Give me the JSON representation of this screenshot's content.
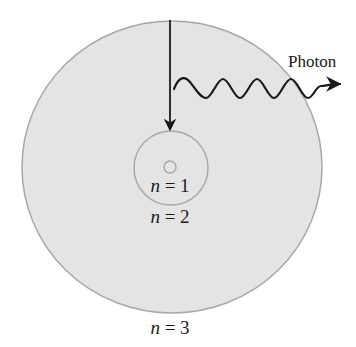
{
  "figure": {
    "photon_label": "Photon",
    "levels": [
      {
        "var": "n",
        "eq": " = 1",
        "label": "n = 1"
      },
      {
        "var": "n",
        "eq": " = 2",
        "label": "n = 2"
      },
      {
        "var": "n",
        "eq": " = 3",
        "label": "n = 3"
      }
    ],
    "colors": {
      "orbit_fill": "#e4e4e4",
      "orbit_stroke": "#a8a8a8",
      "arrow": "#1a1a1a",
      "wave": "#1a1a1a",
      "text": "#1a1a1a",
      "background": "#ffffff"
    }
  }
}
